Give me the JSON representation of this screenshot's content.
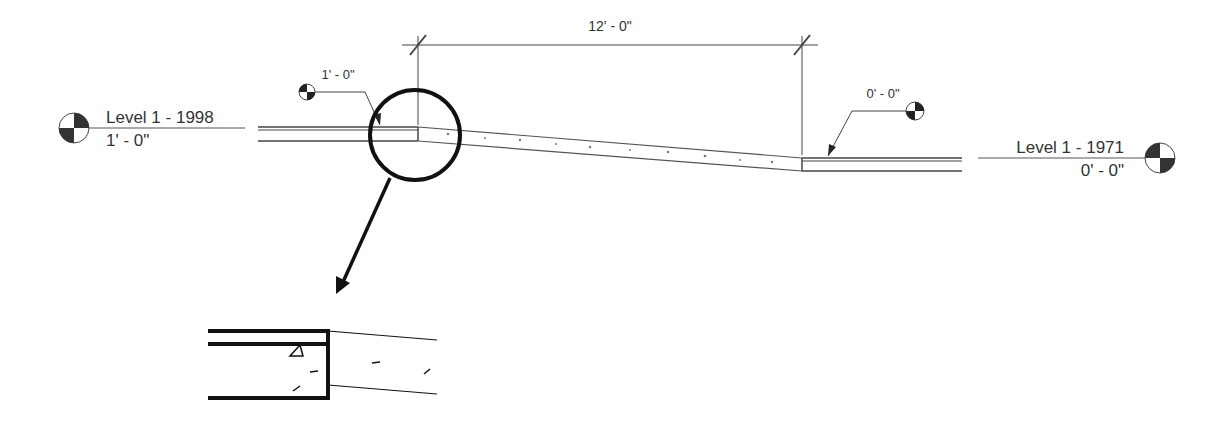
{
  "dimension": {
    "label": "12' - 0\""
  },
  "levels": {
    "left": {
      "name": "Level 1 - 1998",
      "elevation": "1' - 0\""
    },
    "right": {
      "name": "Level 1 - 1971",
      "elevation": "0' - 0\""
    }
  },
  "spot_elevations": {
    "left": {
      "value": "1' - 0\""
    },
    "right": {
      "value": "0' - 0\""
    }
  },
  "colors": {
    "line": "#333333",
    "heavy": "#111111",
    "background": "#ffffff"
  }
}
